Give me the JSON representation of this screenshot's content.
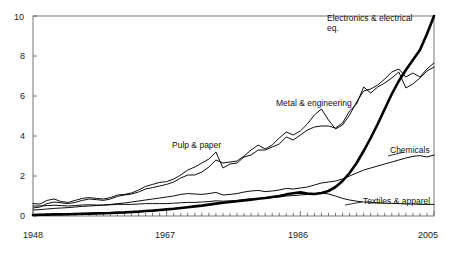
{
  "chart_data": {
    "type": "line",
    "title": "",
    "subtitle": "",
    "xlabel": "",
    "ylabel": "",
    "xlim": [
      1948,
      2005
    ],
    "ylim": [
      0,
      10
    ],
    "x_ticks": [
      1948,
      1967,
      1986,
      2005
    ],
    "x_tick_labels": [
      "1948",
      "1967",
      "1986",
      "2005"
    ],
    "minor_x_ticks": true,
    "y_ticks": [
      0,
      2,
      4,
      6,
      8,
      10
    ],
    "y_tick_labels": [
      "0",
      "2",
      "4",
      "6",
      "8",
      "10"
    ],
    "grid": false,
    "legend_position": "inline-annotations",
    "frame": "box",
    "series": [
      {
        "name": "Electronics & electrical eq.",
        "label": "Electronics & electrical eq.",
        "emphasis": "thick",
        "x": [
          1948,
          1949,
          1950,
          1951,
          1952,
          1953,
          1954,
          1955,
          1956,
          1957,
          1958,
          1959,
          1960,
          1961,
          1962,
          1963,
          1964,
          1965,
          1966,
          1967,
          1968,
          1969,
          1970,
          1971,
          1972,
          1973,
          1974,
          1975,
          1976,
          1977,
          1978,
          1979,
          1980,
          1981,
          1982,
          1983,
          1984,
          1985,
          1986,
          1987,
          1988,
          1989,
          1990,
          1991,
          1992,
          1993,
          1994,
          1995,
          1996,
          1997,
          1998,
          1999,
          2000,
          2001,
          2002,
          2003,
          2004,
          2005
        ],
        "values": [
          0.05,
          0.06,
          0.07,
          0.08,
          0.08,
          0.09,
          0.1,
          0.11,
          0.12,
          0.13,
          0.14,
          0.15,
          0.17,
          0.18,
          0.2,
          0.22,
          0.25,
          0.27,
          0.3,
          0.33,
          0.36,
          0.4,
          0.44,
          0.48,
          0.52,
          0.57,
          0.62,
          0.66,
          0.7,
          0.74,
          0.78,
          0.82,
          0.86,
          0.9,
          0.95,
          1.0,
          1.08,
          1.14,
          1.18,
          1.12,
          1.1,
          1.15,
          1.25,
          1.45,
          1.75,
          2.15,
          2.65,
          3.25,
          3.9,
          4.6,
          5.35,
          6.1,
          6.75,
          7.3,
          7.8,
          8.3,
          9.1,
          10.0
        ]
      },
      {
        "name": "Metal & engineering",
        "label": "Metal & engineering",
        "emphasis": "normal",
        "x": [
          1948,
          1949,
          1950,
          1951,
          1952,
          1953,
          1954,
          1955,
          1956,
          1957,
          1958,
          1959,
          1960,
          1961,
          1962,
          1963,
          1964,
          1965,
          1966,
          1967,
          1968,
          1969,
          1970,
          1971,
          1972,
          1973,
          1974,
          1975,
          1976,
          1977,
          1978,
          1979,
          1980,
          1981,
          1982,
          1983,
          1984,
          1985,
          1986,
          1987,
          1988,
          1989,
          1990,
          1991,
          1992,
          1993,
          1994,
          1995,
          1996,
          1997,
          1998,
          1999,
          2000,
          2001,
          2002,
          2003,
          2004,
          2005
        ],
        "values": [
          0.4,
          0.45,
          0.62,
          0.7,
          0.66,
          0.62,
          0.68,
          0.78,
          0.85,
          0.82,
          0.78,
          0.85,
          0.98,
          1.05,
          1.1,
          1.2,
          1.35,
          1.42,
          1.5,
          1.58,
          1.7,
          1.9,
          2.05,
          2.05,
          2.2,
          2.45,
          2.8,
          2.65,
          2.7,
          2.75,
          3.0,
          3.3,
          3.55,
          3.35,
          3.55,
          3.9,
          4.2,
          4.05,
          4.25,
          4.6,
          5.05,
          5.35,
          4.8,
          4.35,
          4.55,
          5.05,
          5.7,
          6.25,
          6.35,
          6.55,
          6.85,
          7.2,
          7.35,
          6.95,
          7.15,
          6.95,
          7.35,
          7.65
        ]
      },
      {
        "name": "Pulp & paper",
        "label": "Pulp & paper",
        "emphasis": "normal",
        "x": [
          1948,
          1949,
          1950,
          1951,
          1952,
          1953,
          1954,
          1955,
          1956,
          1957,
          1958,
          1959,
          1960,
          1961,
          1962,
          1963,
          1964,
          1965,
          1966,
          1967,
          1968,
          1969,
          1970,
          1971,
          1972,
          1973,
          1974,
          1975,
          1976,
          1977,
          1978,
          1979,
          1980,
          1981,
          1982,
          1983,
          1984,
          1985,
          1986,
          1987,
          1988,
          1989,
          1990,
          1991,
          1992,
          1993,
          1994,
          1995,
          1996,
          1997,
          1998,
          1999,
          2000,
          2001,
          2002,
          2003,
          2004,
          2005
        ],
        "values": [
          0.62,
          0.6,
          0.78,
          0.85,
          0.72,
          0.68,
          0.78,
          0.88,
          0.92,
          0.88,
          0.85,
          0.92,
          1.05,
          1.08,
          1.15,
          1.3,
          1.48,
          1.58,
          1.68,
          1.72,
          1.85,
          2.05,
          2.3,
          2.45,
          2.65,
          2.85,
          3.2,
          2.4,
          2.6,
          2.65,
          2.95,
          3.05,
          3.3,
          3.3,
          3.45,
          3.6,
          3.95,
          3.8,
          4.05,
          4.3,
          4.45,
          4.5,
          4.5,
          4.4,
          4.65,
          5.25,
          5.6,
          6.45,
          6.15,
          6.45,
          6.65,
          6.9,
          7.2,
          6.4,
          6.6,
          6.9,
          7.25,
          7.45
        ]
      },
      {
        "name": "Chemicals",
        "label": "Chemicals",
        "emphasis": "normal",
        "x": [
          1948,
          1949,
          1950,
          1951,
          1952,
          1953,
          1954,
          1955,
          1956,
          1957,
          1958,
          1959,
          1960,
          1961,
          1962,
          1963,
          1964,
          1965,
          1966,
          1967,
          1968,
          1969,
          1970,
          1971,
          1972,
          1973,
          1974,
          1975,
          1976,
          1977,
          1978,
          1979,
          1980,
          1981,
          1982,
          1983,
          1984,
          1985,
          1986,
          1987,
          1988,
          1989,
          1990,
          1991,
          1992,
          1993,
          1994,
          1995,
          1996,
          1997,
          1998,
          1999,
          2000,
          2001,
          2002,
          2003,
          2004,
          2005
        ],
        "values": [
          0.3,
          0.32,
          0.35,
          0.38,
          0.4,
          0.42,
          0.45,
          0.48,
          0.5,
          0.52,
          0.55,
          0.58,
          0.62,
          0.65,
          0.7,
          0.75,
          0.8,
          0.85,
          0.9,
          0.95,
          1.0,
          1.08,
          1.12,
          1.1,
          1.08,
          1.12,
          1.18,
          1.05,
          1.08,
          1.12,
          1.2,
          1.25,
          1.28,
          1.22,
          1.25,
          1.3,
          1.38,
          1.35,
          1.4,
          1.45,
          1.55,
          1.65,
          1.7,
          1.75,
          1.85,
          2.0,
          2.15,
          2.3,
          2.4,
          2.5,
          2.6,
          2.7,
          2.8,
          2.9,
          2.98,
          3.02,
          2.95,
          3.05
        ]
      },
      {
        "name": "Textiles & apparel",
        "label": "Textiles & apparel",
        "emphasis": "normal",
        "x": [
          1948,
          1949,
          1950,
          1951,
          1952,
          1953,
          1954,
          1955,
          1956,
          1957,
          1958,
          1959,
          1960,
          1961,
          1962,
          1963,
          1964,
          1965,
          1966,
          1967,
          1968,
          1969,
          1970,
          1971,
          1972,
          1973,
          1974,
          1975,
          1976,
          1977,
          1978,
          1979,
          1980,
          1981,
          1982,
          1983,
          1984,
          1985,
          1986,
          1987,
          1988,
          1989,
          1990,
          1991,
          1992,
          1993,
          1994,
          1995,
          1996,
          1997,
          1998,
          1999,
          2000,
          2001,
          2002,
          2003,
          2004,
          2005
        ],
        "values": [
          0.5,
          0.5,
          0.52,
          0.54,
          0.52,
          0.5,
          0.52,
          0.55,
          0.56,
          0.55,
          0.54,
          0.56,
          0.58,
          0.58,
          0.58,
          0.6,
          0.62,
          0.62,
          0.62,
          0.62,
          0.64,
          0.66,
          0.68,
          0.68,
          0.7,
          0.72,
          0.76,
          0.74,
          0.76,
          0.78,
          0.82,
          0.85,
          0.88,
          0.88,
          0.92,
          0.95,
          1.0,
          1.02,
          1.05,
          1.08,
          1.12,
          1.15,
          1.1,
          1.0,
          0.88,
          0.8,
          0.74,
          0.7,
          0.68,
          0.66,
          0.64,
          0.63,
          0.62,
          0.6,
          0.6,
          0.58,
          0.58,
          0.58
        ]
      }
    ],
    "annotations": [
      {
        "text": "Electronics & electrical eq.",
        "for": "Electronics & electrical eq."
      },
      {
        "text": "Metal & engineering",
        "for": "Metal & engineering"
      },
      {
        "text": "Pulp & paper",
        "for": "Pulp & paper"
      },
      {
        "text": "Chemicals",
        "for": "Chemicals"
      },
      {
        "text": "Textiles & apparel",
        "for": "Textiles & apparel"
      }
    ]
  }
}
